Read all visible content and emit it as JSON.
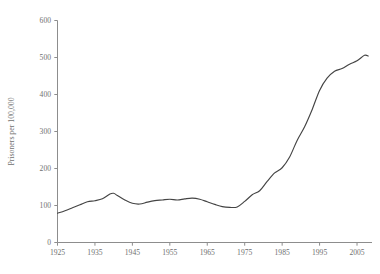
{
  "chart_data": {
    "type": "line",
    "title": "",
    "subtitle": "",
    "xlabel": "",
    "ylabel": "Prisoners per 100,000",
    "xlim": [
      1925,
      2009
    ],
    "ylim": [
      0,
      600
    ],
    "grid": false,
    "legend": null,
    "xticks": [
      1925,
      1935,
      1945,
      1955,
      1965,
      1975,
      1985,
      1995,
      2005
    ],
    "xtick_labels": [
      "1925",
      "1935",
      "1945",
      "1955",
      "1965",
      "1975",
      "1985",
      "1995",
      "2005"
    ],
    "yticks": [
      0,
      100,
      200,
      300,
      400,
      500,
      600
    ],
    "ytick_labels": [
      "0",
      "100",
      "200",
      "300",
      "400",
      "500",
      "600"
    ],
    "line_color": "#444444",
    "axis_color": "#8d8d8d",
    "background_color": "#ffffff",
    "series": [
      {
        "name": "Prisoners per 100,000",
        "x": [
          1925,
          1927,
          1929,
          1931,
          1933,
          1935,
          1937,
          1939,
          1940,
          1941,
          1943,
          1945,
          1947,
          1949,
          1951,
          1953,
          1955,
          1957,
          1959,
          1961,
          1963,
          1965,
          1967,
          1969,
          1971,
          1973,
          1975,
          1977,
          1979,
          1981,
          1983,
          1985,
          1987,
          1989,
          1991,
          1993,
          1995,
          1997,
          1999,
          2001,
          2003,
          2005,
          2007,
          2008
        ],
        "values": [
          79,
          86,
          94,
          102,
          110,
          113,
          118,
          131,
          133,
          127,
          115,
          106,
          104,
          109,
          113,
          115,
          117,
          115,
          118,
          120,
          117,
          110,
          103,
          97,
          95,
          96,
          111,
          129,
          140,
          165,
          188,
          202,
          231,
          276,
          313,
          359,
          411,
          444,
          463,
          470,
          482,
          491,
          506,
          504
        ],
        "units": "prisoners per 100,000 population"
      }
    ],
    "annotations": []
  }
}
